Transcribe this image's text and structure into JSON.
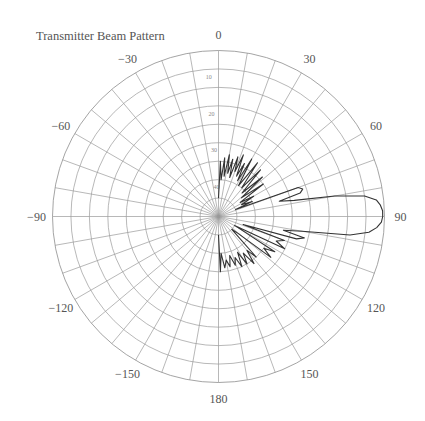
{
  "chart_data": {
    "type": "polar-line",
    "title": "Transmitter Beam Pattern",
    "angle_unit": "degrees",
    "angle_zero": "top",
    "angle_direction": "clockwise",
    "angle_tick_labels": [
      "0",
      "30",
      "60",
      "90",
      "120",
      "150",
      "180",
      "−150",
      "−120",
      "−90",
      "−60",
      "−30"
    ],
    "angle_ticks": [
      0,
      30,
      60,
      90,
      120,
      150,
      180,
      -150,
      -120,
      -90,
      -60,
      -30
    ],
    "angle_grid_step": 10,
    "radial_axis": "attenuation (dB), 0 at outer ring, 40 at inner ring",
    "radial_tick_labels": [
      "10",
      "20",
      "30",
      "40"
    ],
    "radial_ticks": [
      10,
      20,
      30,
      40
    ],
    "radial_grid_step": 5,
    "rlim": [
      0,
      40
    ],
    "grid": true,
    "series": [
      {
        "name": "beam pattern",
        "points": [
          [
            0,
            40
          ],
          [
            2,
            30
          ],
          [
            4,
            35
          ],
          [
            6,
            29
          ],
          [
            8,
            34
          ],
          [
            10,
            28
          ],
          [
            12,
            33
          ],
          [
            14,
            29
          ],
          [
            16,
            34
          ],
          [
            18,
            28
          ],
          [
            20,
            32
          ],
          [
            22,
            27
          ],
          [
            24,
            33
          ],
          [
            26,
            29
          ],
          [
            28,
            34
          ],
          [
            30,
            27
          ],
          [
            33,
            35
          ],
          [
            36,
            27
          ],
          [
            39,
            35
          ],
          [
            42,
            28
          ],
          [
            45,
            36
          ],
          [
            48,
            29
          ],
          [
            51,
            37
          ],
          [
            54,
            30
          ],
          [
            57,
            38
          ],
          [
            60,
            34
          ],
          [
            63,
            38
          ],
          [
            66,
            35
          ],
          [
            68,
            40
          ],
          [
            70,
            22
          ],
          [
            72,
            21
          ],
          [
            74,
            22
          ],
          [
            76,
            28
          ],
          [
            78,
            24
          ],
          [
            80,
            13
          ],
          [
            82,
            5
          ],
          [
            84,
            2
          ],
          [
            86,
            1
          ],
          [
            88,
            0.5
          ],
          [
            90,
            0.5
          ],
          [
            92,
            0.8
          ],
          [
            94,
            2
          ],
          [
            96,
            4
          ],
          [
            98,
            9
          ],
          [
            100,
            22
          ],
          [
            102,
            27
          ],
          [
            104,
            21
          ],
          [
            106,
            23
          ],
          [
            108,
            38
          ],
          [
            110,
            26
          ],
          [
            113,
            28
          ],
          [
            116,
            25
          ],
          [
            119,
            40
          ],
          [
            122,
            27
          ],
          [
            125,
            30
          ],
          [
            128,
            27
          ],
          [
            131,
            38
          ],
          [
            134,
            40
          ],
          [
            137,
            30
          ],
          [
            140,
            33
          ],
          [
            143,
            29
          ],
          [
            146,
            33
          ],
          [
            149,
            30
          ],
          [
            152,
            34
          ],
          [
            155,
            30
          ],
          [
            158,
            33
          ],
          [
            161,
            31
          ],
          [
            164,
            34
          ],
          [
            167,
            31
          ],
          [
            170,
            33
          ],
          [
            173,
            31
          ],
          [
            176,
            35
          ],
          [
            178,
            30
          ],
          [
            180,
            40
          ]
        ]
      }
    ]
  }
}
